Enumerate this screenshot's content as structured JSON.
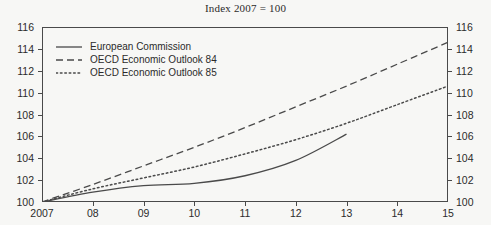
{
  "chart_data": {
    "type": "line",
    "title": "Index 2007 = 100",
    "xlabel": "",
    "ylabel": "",
    "ylim": [
      100,
      116
    ],
    "xlim": [
      2007,
      2015
    ],
    "ytick_labels": [
      "116",
      "114",
      "112",
      "110",
      "108",
      "106",
      "104",
      "102",
      "100"
    ],
    "ytick_values": [
      116,
      114,
      112,
      110,
      108,
      106,
      104,
      102,
      100
    ],
    "xtick_labels": [
      "2007",
      "08",
      "09",
      "10",
      "11",
      "12",
      "13",
      "14",
      "15"
    ],
    "xtick_values": [
      2007,
      2008,
      2009,
      2010,
      2011,
      2012,
      2013,
      2014,
      2015
    ],
    "grid": false,
    "legend_position": "top-left",
    "dual_y_axis": true,
    "series": [
      {
        "name": "European Commission",
        "style": "solid",
        "color": "#4a4a4a",
        "x": [
          2007,
          2008,
          2009,
          2010,
          2011,
          2012,
          2013
        ],
        "values": [
          100.0,
          100.9,
          101.5,
          101.7,
          102.4,
          103.8,
          106.2
        ]
      },
      {
        "name": "OECD Economic Outlook 84",
        "style": "dashed",
        "color": "#4a4a4a",
        "x": [
          2007,
          2008,
          2009,
          2010,
          2011,
          2012,
          2013,
          2014,
          2015
        ],
        "values": [
          100.0,
          101.6,
          103.3,
          105.0,
          106.8,
          108.7,
          110.6,
          112.6,
          114.6
        ]
      },
      {
        "name": "OECD Economic Outlook 85",
        "style": "dotted",
        "color": "#4a4a4a",
        "x": [
          2007,
          2008,
          2009,
          2010,
          2011,
          2012,
          2013,
          2014,
          2015
        ],
        "values": [
          100.0,
          101.2,
          102.2,
          103.2,
          104.4,
          105.7,
          107.2,
          108.9,
          110.6
        ]
      }
    ]
  },
  "axis": {
    "frame_color": "#4a4a4a"
  }
}
